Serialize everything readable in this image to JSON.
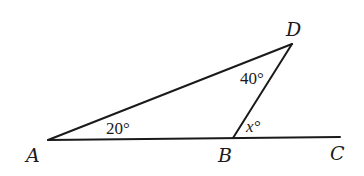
{
  "diagram": {
    "points": {
      "A": {
        "label": "A",
        "x": 48,
        "y": 140
      },
      "B": {
        "label": "B",
        "x": 233,
        "y": 138
      },
      "C": {
        "label": "C",
        "x": 340,
        "y": 137
      },
      "D": {
        "label": "D",
        "x": 292,
        "y": 44
      }
    },
    "segments": [
      {
        "from": "A",
        "to": "C",
        "name": "line-AC"
      },
      {
        "from": "A",
        "to": "D",
        "name": "segment-AD"
      },
      {
        "from": "B",
        "to": "D",
        "name": "segment-BD"
      }
    ],
    "angles": {
      "at_A": "20°",
      "at_D": "40°",
      "at_B_exterior": "x°"
    },
    "colors": {
      "stroke": "#1a1a1a",
      "background": "#ffffff"
    }
  }
}
